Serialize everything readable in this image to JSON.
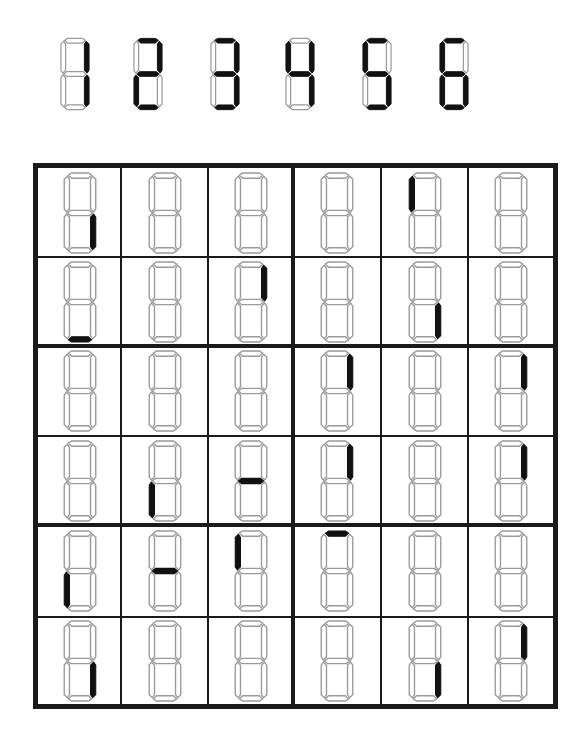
{
  "legend": {
    "digits": [
      {
        "value": "1",
        "segments": [
          "b",
          "c"
        ]
      },
      {
        "value": "2",
        "segments": [
          "a",
          "b",
          "g",
          "e",
          "d"
        ]
      },
      {
        "value": "3",
        "segments": [
          "a",
          "b",
          "g",
          "c",
          "d"
        ]
      },
      {
        "value": "4",
        "segments": [
          "f",
          "g",
          "b",
          "c"
        ]
      },
      {
        "value": "5",
        "segments": [
          "a",
          "f",
          "g",
          "c",
          "d"
        ]
      },
      {
        "value": "6",
        "segments": [
          "a",
          "f",
          "g",
          "e",
          "c",
          "d"
        ]
      }
    ],
    "segment_key": {
      "a": "top",
      "b": "top-right",
      "c": "bottom-right",
      "d": "bottom",
      "e": "bottom-left",
      "f": "top-left",
      "g": "middle"
    }
  },
  "board": {
    "rows": 6,
    "cols": 6,
    "box_rows": 2,
    "box_cols": 3,
    "colors": {
      "lit": "#111111",
      "unlit_outline": "#9a9a9a",
      "grid": "#1a1a1a",
      "background": "#ffffff"
    },
    "cells": [
      [
        [
          "c"
        ],
        [],
        [],
        [],
        [
          "f"
        ],
        []
      ],
      [
        [
          "d"
        ],
        [],
        [
          "b"
        ],
        [],
        [
          "c"
        ],
        []
      ],
      [
        [],
        [],
        [],
        [
          "b"
        ],
        [],
        [
          "b"
        ]
      ],
      [
        [],
        [
          "e"
        ],
        [
          "g"
        ],
        [
          "b"
        ],
        [],
        [
          "b"
        ]
      ],
      [
        [
          "e"
        ],
        [
          "g"
        ],
        [
          "f"
        ],
        [
          "a"
        ],
        [],
        []
      ],
      [
        [
          "c"
        ],
        [],
        [],
        [],
        [
          "c"
        ],
        [
          "b"
        ]
      ]
    ]
  }
}
